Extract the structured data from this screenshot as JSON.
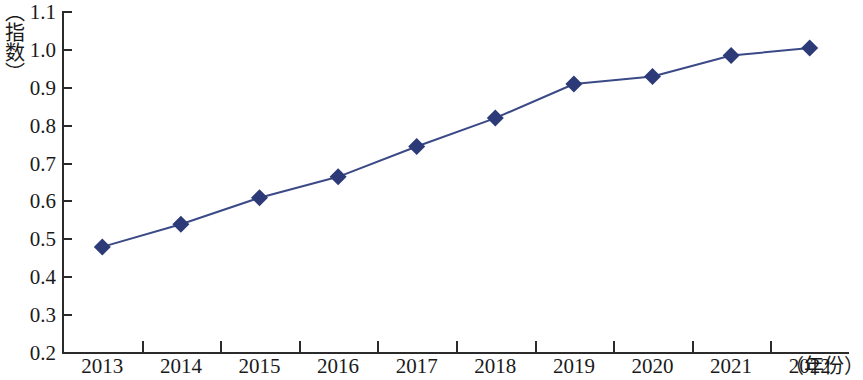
{
  "chart_data": {
    "type": "line",
    "title": "",
    "subtitle": "",
    "xlabel": "（年份）",
    "ylabel": "（指数）",
    "categories": [
      "2013",
      "2014",
      "2015",
      "2016",
      "2017",
      "2018",
      "2019",
      "2020",
      "2021",
      "2022"
    ],
    "x": [
      2013,
      2014,
      2015,
      2016,
      2017,
      2018,
      2019,
      2020,
      2021,
      2022
    ],
    "values": [
      0.48,
      0.54,
      0.61,
      0.665,
      0.745,
      0.82,
      0.91,
      0.93,
      0.985,
      1.005
    ],
    "series": [
      {
        "name": "指数",
        "values": [
          0.48,
          0.54,
          0.61,
          0.665,
          0.745,
          0.82,
          0.91,
          0.93,
          0.985,
          1.005
        ]
      }
    ],
    "ylim": [
      0.2,
      1.1
    ],
    "ytick_labels": [
      "1.1",
      "1.0",
      "0.9",
      "0.8",
      "0.7",
      "0.6",
      "0.5",
      "0.4",
      "0.3",
      "0.2"
    ],
    "ytick_values": [
      1.1,
      1.0,
      0.9,
      0.8,
      0.7,
      0.6,
      0.5,
      0.4,
      0.3,
      0.2
    ],
    "grid": false,
    "legend": false,
    "legend_position": "none",
    "marker": "diamond",
    "colors": {
      "line": "#3b4a86",
      "marker": "#2c3a78",
      "axis": "#2b2b2b",
      "text": "#1a1a1a",
      "background": "#ffffff"
    }
  }
}
